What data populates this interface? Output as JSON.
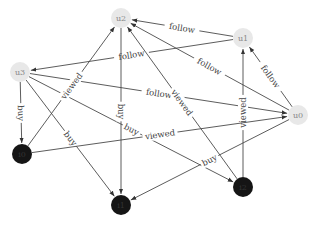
{
  "diagram": {
    "type": "directed-graph",
    "nodes": [
      {
        "id": "u0",
        "label": "u0",
        "kind": "user",
        "x": 298,
        "y": 115,
        "color": "#e8e8e8"
      },
      {
        "id": "u1",
        "label": "u1",
        "kind": "user",
        "x": 243,
        "y": 38,
        "color": "#e8e8e8"
      },
      {
        "id": "u2",
        "label": "u2",
        "kind": "user",
        "x": 121,
        "y": 18,
        "color": "#e8e8e8"
      },
      {
        "id": "u3",
        "label": "u3",
        "kind": "user",
        "x": 20,
        "y": 72,
        "color": "#e8e8e8"
      },
      {
        "id": "i0",
        "label": "i0",
        "kind": "item",
        "x": 22,
        "y": 154,
        "color": "#151515"
      },
      {
        "id": "i1",
        "label": "i1",
        "kind": "item",
        "x": 121,
        "y": 205,
        "color": "#151515"
      },
      {
        "id": "i2",
        "label": "i2",
        "kind": "item",
        "x": 243,
        "y": 187,
        "color": "#151515"
      }
    ],
    "edges": [
      {
        "from": "u1",
        "to": "u2",
        "label": "follow"
      },
      {
        "from": "u1",
        "to": "u3",
        "label": "follow"
      },
      {
        "from": "u0",
        "to": "u2",
        "label": "follow"
      },
      {
        "from": "u0",
        "to": "u1",
        "label": "follow"
      },
      {
        "from": "u3",
        "to": "u0",
        "label": "follow"
      },
      {
        "from": "u3",
        "to": "i0",
        "label": "buy"
      },
      {
        "from": "u3",
        "to": "i1",
        "label": "buy"
      },
      {
        "from": "u3",
        "to": "i2",
        "label": "buy"
      },
      {
        "from": "i0",
        "to": "u2",
        "label": "viewed"
      },
      {
        "from": "u2",
        "to": "i1",
        "label": "buy"
      },
      {
        "from": "i2",
        "to": "u2",
        "label": "viewed"
      },
      {
        "from": "i2",
        "to": "u1",
        "label": "viewed"
      },
      {
        "from": "i0",
        "to": "u0",
        "label": "viewed"
      },
      {
        "from": "u0",
        "to": "i1",
        "label": "buy"
      }
    ]
  }
}
